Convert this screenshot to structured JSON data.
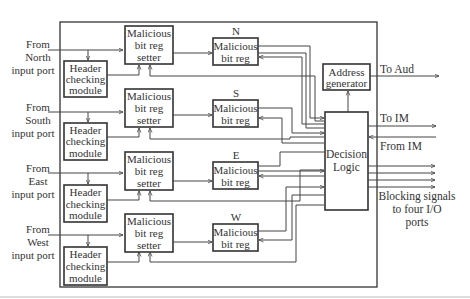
{
  "diagram": {
    "inputs": [
      {
        "id": "north",
        "lines": [
          "From",
          "North",
          "input port"
        ]
      },
      {
        "id": "south",
        "lines": [
          "From",
          "South",
          "input port"
        ]
      },
      {
        "id": "east",
        "lines": [
          "From",
          "East",
          "input port"
        ]
      },
      {
        "id": "west",
        "lines": [
          "From",
          "West",
          "input port"
        ]
      }
    ],
    "header_module": {
      "lines": [
        "Header",
        "checking",
        "module"
      ]
    },
    "setter": {
      "lines": [
        "Malicious",
        "bit reg",
        "setter"
      ]
    },
    "bit_reg": {
      "lines": [
        "Malicious",
        "bit reg"
      ]
    },
    "direction_labels": [
      "N",
      "S",
      "E",
      "W"
    ],
    "address_generator": {
      "lines": [
        "Address",
        "generator"
      ]
    },
    "decision_logic": {
      "lines": [
        "Decision",
        "Logic"
      ]
    },
    "outputs": {
      "to_aud": "To Aud",
      "to_im": "To IM",
      "from_im": "From IM",
      "blocking": [
        "Blocking signals",
        "to four I/O",
        "ports"
      ]
    }
  }
}
